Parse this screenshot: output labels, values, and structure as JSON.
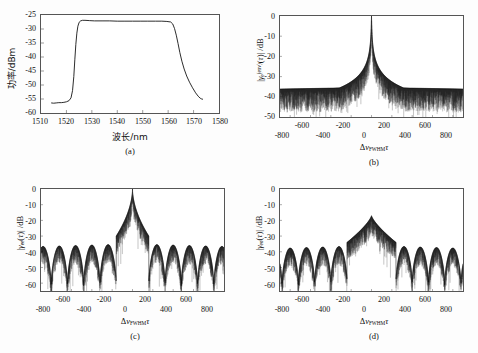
{
  "figure": {
    "caption_panels": [
      "(a)",
      "(b)",
      "(c)",
      "(d)"
    ]
  },
  "chart_data": [
    {
      "id": "panel-a",
      "type": "line",
      "panel_label": "(a)",
      "title": "",
      "xlabel": "波长/nm",
      "ylabel": "功率/dBm",
      "xlim": [
        1510,
        1580
      ],
      "ylim": [
        -60,
        -25
      ],
      "xticks": [
        1510,
        1520,
        1530,
        1540,
        1550,
        1560,
        1570,
        1580
      ],
      "yticks": [
        -25,
        -30,
        -35,
        -40,
        -45,
        -50,
        -55,
        -60
      ],
      "grid": false,
      "legend": "none",
      "series": [
        {
          "name": "ASE flat-top spectrum",
          "x": [
            1514.0,
            1515.0,
            1516.0,
            1517.0,
            1518.0,
            1519.0,
            1520.0,
            1521.0,
            1521.8,
            1522.4,
            1522.9,
            1523.3,
            1523.7,
            1524.1,
            1524.5,
            1525.0,
            1525.6,
            1526.3,
            1527.3,
            1529.0,
            1531.0,
            1534.0,
            1537.0,
            1540.0,
            1543.0,
            1546.0,
            1549.0,
            1552.0,
            1555.0,
            1557.5,
            1559.5,
            1561.0,
            1561.8,
            1562.5,
            1563.2,
            1563.9,
            1564.6,
            1565.4,
            1566.3,
            1567.3,
            1568.4,
            1569.6,
            1570.8,
            1571.8,
            1572.6,
            1573.2,
            1573.7
          ],
          "y": [
            -56.4,
            -56.5,
            -56.4,
            -56.3,
            -56.3,
            -56.2,
            -56.0,
            -55.6,
            -54.6,
            -52.0,
            -47.0,
            -41.0,
            -35.5,
            -31.5,
            -29.0,
            -27.6,
            -27.1,
            -26.9,
            -26.9,
            -27.0,
            -27.1,
            -27.1,
            -27.1,
            -27.2,
            -27.2,
            -27.2,
            -27.2,
            -27.2,
            -27.2,
            -27.2,
            -27.3,
            -27.5,
            -28.2,
            -29.8,
            -32.2,
            -35.2,
            -38.4,
            -41.5,
            -44.3,
            -46.8,
            -49.0,
            -51.0,
            -52.8,
            -54.0,
            -54.7,
            -55.0,
            -55.1
          ]
        }
      ]
    },
    {
      "id": "panel-b",
      "type": "line",
      "panel_label": "(b)",
      "title": "",
      "xlabel": "ΔνFWHMτ",
      "xlabel_parts": {
        "delta": "Δ",
        "nu": "ν",
        "sub": "FWHM",
        "tau": "τ"
      },
      "ylabel": "|γe(env)(τ)| /dB",
      "ylabel_parts": {
        "gamma": "γ",
        "sub": "e",
        "sup": "(env)",
        "tau": "τ",
        "unit": "/dB"
      },
      "xlim": [
        -900,
        900
      ],
      "ylim": [
        -50,
        0
      ],
      "xticks": [
        -800,
        -600,
        -400,
        -200,
        0,
        200,
        400,
        600,
        800
      ],
      "yticks": [
        0,
        -10,
        -20,
        -30,
        -40,
        -50
      ],
      "grid": false,
      "legend": "none",
      "description": "single sharp central coherence peak reaching 0 dB with Lorentzian-like decay to a noisy floor",
      "peak_db": 0,
      "noise_floor_db": -36,
      "noise_floor_low_db": -49,
      "lobe_nulls": [],
      "envelope_points": [
        {
          "x": -900,
          "y": -35.5
        },
        {
          "x": -700,
          "y": -35.2
        },
        {
          "x": -500,
          "y": -34.6
        },
        {
          "x": -300,
          "y": -33.2
        },
        {
          "x": -180,
          "y": -31.5
        },
        {
          "x": -100,
          "y": -29.0
        },
        {
          "x": -60,
          "y": -26.0
        },
        {
          "x": -30,
          "y": -21.5
        },
        {
          "x": -14,
          "y": -16.0
        },
        {
          "x": -6,
          "y": -10.5
        },
        {
          "x": -2,
          "y": -5.0
        },
        {
          "x": 0,
          "y": 0
        },
        {
          "x": 2,
          "y": -5.0
        },
        {
          "x": 6,
          "y": -10.5
        },
        {
          "x": 14,
          "y": -16.0
        },
        {
          "x": 30,
          "y": -21.5
        },
        {
          "x": 60,
          "y": -26.0
        },
        {
          "x": 100,
          "y": -29.0
        },
        {
          "x": 180,
          "y": -31.5
        },
        {
          "x": 300,
          "y": -33.2
        },
        {
          "x": 500,
          "y": -34.6
        },
        {
          "x": 700,
          "y": -35.2
        },
        {
          "x": 900,
          "y": -35.5
        }
      ]
    },
    {
      "id": "panel-c",
      "type": "line",
      "panel_label": "(c)",
      "title": "",
      "xlabel": "ΔνFWHMτ",
      "xlabel_parts": {
        "delta": "Δ",
        "nu": "ν",
        "sub": "FWHM",
        "tau": "τ"
      },
      "ylabel": "|γee(τ)| /dB",
      "ylabel_parts": {
        "gamma": "γ",
        "sub": "ee",
        "sup": "",
        "tau": "τ",
        "unit": "/dB"
      },
      "xlim": [
        -900,
        900
      ],
      "ylim": [
        -65,
        0
      ],
      "xticks": [
        -800,
        -600,
        -400,
        -200,
        0,
        200,
        400,
        600,
        800
      ],
      "yticks": [
        0,
        -10,
        -20,
        -30,
        -40,
        -50,
        -60
      ],
      "grid": false,
      "legend": "none",
      "description": "narrow central peak at 0 dB on a broad -20 dB pedestal with periodic sidelobes; deep nulls every ~160 units",
      "peak_db": 0,
      "main_lobe_half_width": 160,
      "sidelobe_peak_db": -35,
      "noise_floor_db": -45,
      "lobe_nulls": [
        -800,
        -640,
        -480,
        -320,
        -165,
        165,
        320,
        480,
        640,
        800
      ],
      "sidelobe_peaks_x": [
        -720,
        -560,
        -400,
        -240,
        240,
        400,
        560,
        720
      ],
      "sidelobe_peaks_db": [
        -36,
        -35.5,
        -35,
        -34.5,
        -34.5,
        -35,
        -35.5,
        -36
      ]
    },
    {
      "id": "panel-d",
      "type": "line",
      "panel_label": "(d)",
      "title": "",
      "xlabel": "ΔνFWHMτ",
      "xlabel_parts": {
        "delta": "Δ",
        "nu": "ν",
        "sub": "FWHM",
        "tau": "τ"
      },
      "ylabel": "|γeo(τ)| /dB",
      "ylabel_parts": {
        "gamma": "γ",
        "sub": "eo",
        "sup": "",
        "tau": "τ",
        "unit": "/dB"
      },
      "xlim": [
        -900,
        900
      ],
      "ylim": [
        -65,
        0
      ],
      "xticks": [
        -800,
        -600,
        -400,
        -200,
        0,
        200,
        400,
        600,
        800
      ],
      "yticks": [
        0,
        -10,
        -20,
        -30,
        -40,
        -50,
        -60
      ],
      "grid": false,
      "legend": "none",
      "description": "suppressed central peak near -17 dB with a wide central lobe and periodic sidelobes; nulls every ~160 units",
      "peak_db": -17,
      "main_lobe_half_width": 240,
      "sidelobe_peak_db": -36,
      "noise_floor_db": -46,
      "lobe_nulls": [
        -800,
        -640,
        -480,
        -240,
        240,
        480,
        640,
        800
      ],
      "sidelobe_peaks_x": [
        -720,
        -560,
        -400,
        -320,
        320,
        400,
        560,
        720
      ],
      "sidelobe_peaks_db": [
        -37,
        -36,
        -35.5,
        -35.5,
        -35.5,
        -35.5,
        -36,
        -37
      ]
    }
  ],
  "panel_a": {
    "label": "(a)",
    "ylabel": "功率/dBm",
    "xlabel": "波长/nm",
    "yticks": [
      "-25",
      "-30",
      "-35",
      "-40",
      "-45",
      "-50",
      "-55",
      "-60"
    ],
    "xticks": [
      "1510",
      "1520",
      "1530",
      "1540",
      "1550",
      "1560",
      "1570",
      "1580"
    ]
  },
  "panel_b": {
    "label": "(b)",
    "yticks": [
      "0",
      "-10",
      "-20",
      "-30",
      "-40",
      "-50"
    ],
    "xticks_upper": [
      "-600",
      "-200",
      "200",
      "600"
    ],
    "xticks_lower": [
      "-800",
      "-400",
      "0",
      "400",
      "800"
    ]
  },
  "panel_c": {
    "label": "(c)",
    "yticks": [
      "0",
      "-10",
      "-20",
      "-30",
      "-40",
      "-50",
      "-60"
    ],
    "xticks_upper": [
      "-600",
      "-200",
      "200",
      "600"
    ],
    "xticks_lower": [
      "-800",
      "-400",
      "0",
      "400",
      "800"
    ]
  },
  "panel_d": {
    "label": "(d)",
    "yticks": [
      "0",
      "-10",
      "-20",
      "-30",
      "-40",
      "-50",
      "-60"
    ],
    "xticks_upper": [
      "-600",
      "-200",
      "200",
      "600"
    ],
    "xticks_lower": [
      "-800",
      "-400",
      "0",
      "400",
      "800"
    ]
  },
  "symbols": {
    "delta": "Δ",
    "nu": "ν",
    "gamma": "γ",
    "tau": "τ",
    "fwhm": "FWHM",
    "env": "(env)",
    "ee": "ee",
    "eo": "eo",
    "e": "e",
    "bar": "|",
    "unit_db": "/dB"
  },
  "colors": {
    "trace": "#111111",
    "frame": "#555555",
    "background": "#ffffff"
  }
}
